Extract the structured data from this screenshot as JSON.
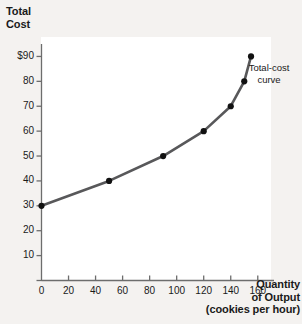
{
  "chart_data": {
    "type": "line",
    "title": "",
    "ylabel": "Total Cost",
    "xlabel": "Quantity of Output (cookies per hour)",
    "xlabel_lines": [
      "Quantity",
      "of Output",
      "(cookies per hour)"
    ],
    "ylabel_lines": [
      "Total",
      "Cost"
    ],
    "series": [
      {
        "name": "Total-cost curve",
        "x": [
          0,
          50,
          90,
          120,
          140,
          150,
          155
        ],
        "values": [
          30,
          40,
          50,
          60,
          70,
          80,
          90
        ]
      }
    ],
    "annotations": [
      {
        "text": "Total-cost curve",
        "lines": [
          "Total-cost",
          "curve"
        ],
        "x": 162,
        "y": 76
      }
    ],
    "xlim": [
      0,
      172
    ],
    "ylim": [
      0,
      95
    ],
    "xticks": [
      0,
      20,
      40,
      60,
      80,
      100,
      120,
      140,
      160
    ],
    "xtick_labels": [
      "0",
      "20",
      "40",
      "60",
      "80",
      "100",
      "120",
      "140",
      "160"
    ],
    "yticks": [
      0,
      10,
      20,
      30,
      40,
      50,
      60,
      70,
      80,
      90
    ],
    "ytick_labels": [
      "",
      "10",
      "20",
      "30",
      "40",
      "50",
      "60",
      "70",
      "80",
      "$90"
    ],
    "grid": false,
    "legend": "none",
    "colors": {
      "line": "#58585a",
      "marker": "#111111",
      "axis": "#6d6d6d",
      "background": "#f4f2f0",
      "plot_background": "#ffffff",
      "text": "#1a1a1a"
    }
  }
}
